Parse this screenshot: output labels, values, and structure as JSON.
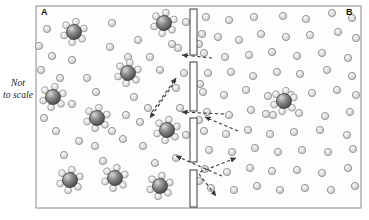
{
  "figure": {
    "type": "diagram",
    "scale_note_line1": "Not",
    "scale_note_line2": "to scale",
    "compartment_a_label": "A",
    "compartment_b_label": "B"
  },
  "colors": {
    "background": "#ffffff",
    "frame_border": "#8a8a8a",
    "panel_fill": "#fdfdfd",
    "solute_core_dark": "#4f4f4f",
    "solute_core_light": "#c9c9c9",
    "water_fill": "#dcdcdc",
    "water_stroke": "#8c8c8c",
    "membrane_fill": "#ffffff",
    "membrane_stroke": "#3a3a3a",
    "arrow_color": "#3a3a3a",
    "text_color": "#111111"
  },
  "frame": {
    "x": 36,
    "y": 6,
    "width": 325,
    "height": 202,
    "stroke_width": 1
  },
  "membrane": {
    "name": "semipermeable-membrane",
    "x": 190,
    "width": 7,
    "bar_stroke_width": 1,
    "bars": [
      {
        "y": 9,
        "height": 46
      },
      {
        "y": 62,
        "height": 49
      },
      {
        "y": 118,
        "height": 44
      },
      {
        "y": 170,
        "height": 37
      }
    ],
    "pores": [
      {
        "y": 58
      },
      {
        "y": 114
      },
      {
        "y": 166
      }
    ]
  },
  "solute_clusters": [
    {
      "side": "A",
      "cx": 74,
      "cy": 32
    },
    {
      "side": "A",
      "cx": 164,
      "cy": 23
    },
    {
      "side": "A",
      "cx": 128,
      "cy": 73
    },
    {
      "side": "A",
      "cx": 53,
      "cy": 97
    },
    {
      "side": "A",
      "cx": 97,
      "cy": 118
    },
    {
      "side": "A",
      "cx": 167,
      "cy": 130
    },
    {
      "side": "A",
      "cx": 70,
      "cy": 180
    },
    {
      "side": "A",
      "cx": 115,
      "cy": 178
    },
    {
      "side": "A",
      "cx": 160,
      "cy": 186
    },
    {
      "side": "B",
      "cx": 284,
      "cy": 101
    }
  ],
  "cluster_geometry": {
    "core_radius": 7.5,
    "satellite_radius": 3.4,
    "satellite_distance": 10.5,
    "satellite_count": 6
  },
  "water_molecules": {
    "radius": 3.6,
    "side_a": [
      [
        47,
        29
      ],
      [
        112,
        23
      ],
      [
        138,
        40
      ],
      [
        110,
        47
      ],
      [
        52,
        56
      ],
      [
        72,
        60
      ],
      [
        87,
        78
      ],
      [
        160,
        70
      ],
      [
        60,
        78
      ],
      [
        96,
        92
      ],
      [
        134,
        97
      ],
      [
        178,
        48
      ],
      [
        176,
        88
      ],
      [
        150,
        57
      ],
      [
        126,
        115
      ],
      [
        56,
        131
      ],
      [
        95,
        146
      ],
      [
        143,
        146
      ],
      [
        128,
        57
      ],
      [
        44,
        118
      ],
      [
        79,
        141
      ],
      [
        180,
        108
      ],
      [
        176,
        158
      ],
      [
        155,
        163
      ],
      [
        123,
        139
      ],
      [
        64,
        155
      ],
      [
        103,
        161
      ],
      [
        186,
        22
      ],
      [
        184,
        73
      ],
      [
        186,
        135
      ],
      [
        39,
        46
      ],
      [
        41,
        70
      ],
      [
        72,
        104
      ],
      [
        148,
        108
      ],
      [
        112,
        131
      ],
      [
        172,
        44
      ],
      [
        140,
        122
      ]
    ],
    "side_b": [
      [
        206,
        17
      ],
      [
        229,
        20
      ],
      [
        254,
        17
      ],
      [
        283,
        16
      ],
      [
        306,
        19
      ],
      [
        332,
        13
      ],
      [
        352,
        18
      ],
      [
        202,
        34
      ],
      [
        218,
        37
      ],
      [
        239,
        40
      ],
      [
        261,
        34
      ],
      [
        286,
        37
      ],
      [
        310,
        35
      ],
      [
        338,
        32
      ],
      [
        356,
        38
      ],
      [
        204,
        53
      ],
      [
        225,
        57
      ],
      [
        249,
        55
      ],
      [
        272,
        52
      ],
      [
        297,
        56
      ],
      [
        322,
        53
      ],
      [
        348,
        58
      ],
      [
        208,
        73
      ],
      [
        231,
        72
      ],
      [
        253,
        76
      ],
      [
        277,
        72
      ],
      [
        300,
        74
      ],
      [
        327,
        70
      ],
      [
        352,
        76
      ],
      [
        203,
        92
      ],
      [
        224,
        95
      ],
      [
        246,
        90
      ],
      [
        268,
        96
      ],
      [
        312,
        93
      ],
      [
        337,
        90
      ],
      [
        356,
        95
      ],
      [
        207,
        112
      ],
      [
        229,
        115
      ],
      [
        251,
        110
      ],
      [
        273,
        115
      ],
      [
        299,
        113
      ],
      [
        325,
        116
      ],
      [
        350,
        112
      ],
      [
        204,
        131
      ],
      [
        226,
        134
      ],
      [
        248,
        130
      ],
      [
        270,
        134
      ],
      [
        294,
        132
      ],
      [
        320,
        130
      ],
      [
        347,
        135
      ],
      [
        209,
        150
      ],
      [
        232,
        152
      ],
      [
        255,
        148
      ],
      [
        278,
        152
      ],
      [
        302,
        150
      ],
      [
        328,
        152
      ],
      [
        353,
        149
      ],
      [
        205,
        169
      ],
      [
        227,
        172
      ],
      [
        250,
        168
      ],
      [
        272,
        171
      ],
      [
        297,
        170
      ],
      [
        322,
        173
      ],
      [
        348,
        168
      ],
      [
        211,
        188
      ],
      [
        234,
        190
      ],
      [
        257,
        186
      ],
      [
        280,
        190
      ],
      [
        305,
        188
      ],
      [
        331,
        190
      ],
      [
        355,
        186
      ],
      [
        199,
        44
      ],
      [
        199,
        120
      ],
      [
        199,
        181
      ],
      [
        200,
        84
      ],
      [
        266,
        114
      ],
      [
        291,
        95
      ]
    ]
  },
  "flow_arrows": [
    {
      "name": "arrow-pore-top-to-a",
      "x1": 212,
      "y1": 58,
      "x2": 182,
      "y2": 55
    },
    {
      "name": "arrow-pore-mid-to-a",
      "x1": 224,
      "y1": 114,
      "x2": 182,
      "y2": 112
    },
    {
      "name": "arrow-b-to-pore-mid",
      "x1": 238,
      "y1": 131,
      "x2": 205,
      "y2": 117
    },
    {
      "name": "arrow-a-diag-up",
      "x1": 152,
      "y1": 112,
      "x2": 176,
      "y2": 78
    },
    {
      "name": "arrow-a-diag-down",
      "x1": 176,
      "y1": 80,
      "x2": 150,
      "y2": 118
    },
    {
      "name": "arrow-pore-low-to-a",
      "x1": 222,
      "y1": 176,
      "x2": 176,
      "y2": 156
    },
    {
      "name": "arrow-pore-low-to-b",
      "x1": 200,
      "y1": 172,
      "x2": 236,
      "y2": 158
    },
    {
      "name": "arrow-pore-low-down",
      "x1": 199,
      "y1": 174,
      "x2": 216,
      "y2": 196
    }
  ]
}
